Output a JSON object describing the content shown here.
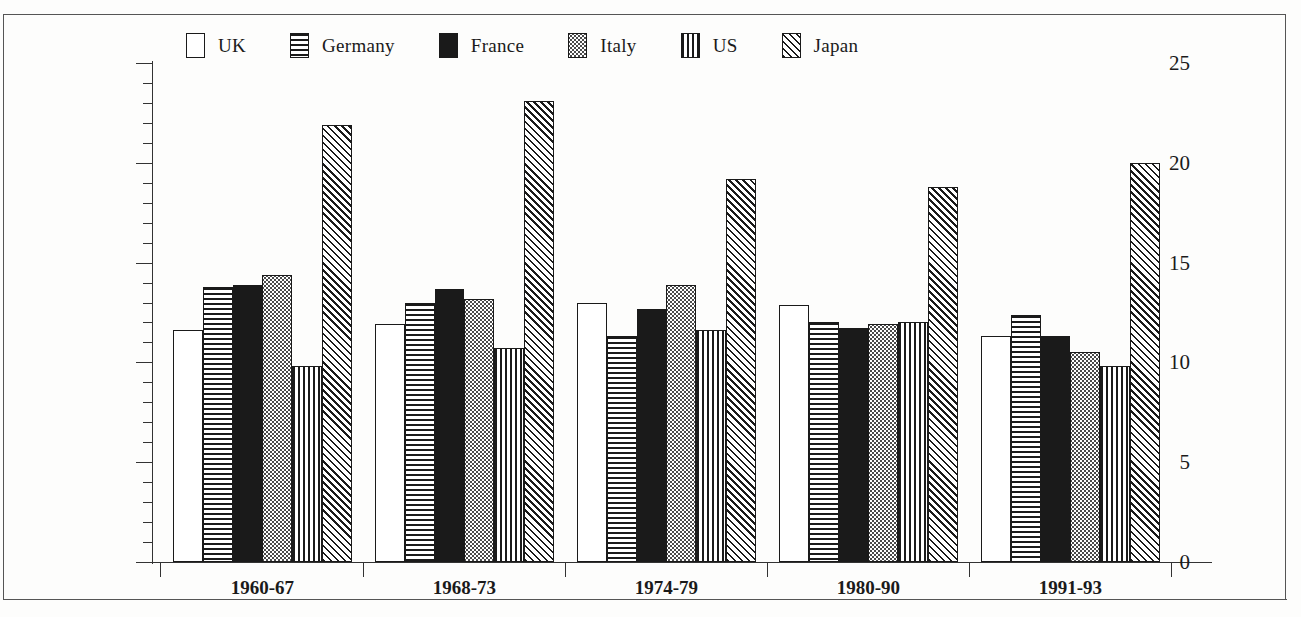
{
  "chart_data": {
    "type": "bar",
    "title": "",
    "subtitle": "",
    "xlabel": "",
    "ylabel": "",
    "ylim": [
      0,
      25
    ],
    "ytick_step_major": 5,
    "ytick_step_minor": 1,
    "ytick_labels": [
      "0",
      "5",
      "10",
      "15",
      "20",
      "25"
    ],
    "grid": false,
    "legend_position": "top",
    "grouping": "grouped",
    "categories": [
      "1960-67",
      "1968-73",
      "1974-79",
      "1980-90",
      "1991-93"
    ],
    "series": [
      {
        "name": "UK",
        "pattern": "plain",
        "values": [
          11.6,
          11.9,
          13.0,
          12.9,
          11.3
        ]
      },
      {
        "name": "Germany",
        "pattern": "hlines",
        "values": [
          13.8,
          13.0,
          11.3,
          12.0,
          12.4
        ]
      },
      {
        "name": "France",
        "pattern": "solid",
        "values": [
          13.9,
          13.7,
          12.7,
          11.7,
          11.3
        ]
      },
      {
        "name": "Italy",
        "pattern": "dots",
        "values": [
          14.4,
          13.2,
          13.9,
          11.9,
          10.5
        ]
      },
      {
        "name": "US",
        "pattern": "vlines",
        "values": [
          9.8,
          10.7,
          11.6,
          12.0,
          9.8
        ]
      },
      {
        "name": "Japan",
        "pattern": "diag",
        "values": [
          21.9,
          23.1,
          19.2,
          18.8,
          20.0
        ]
      }
    ]
  },
  "legend": {
    "items": [
      {
        "label": "UK",
        "pattern": "plain"
      },
      {
        "label": "Germany",
        "pattern": "hlines"
      },
      {
        "label": "France",
        "pattern": "solid"
      },
      {
        "label": "Italy",
        "pattern": "dots"
      },
      {
        "label": "US",
        "pattern": "vlines"
      },
      {
        "label": "Japan",
        "pattern": "diag"
      }
    ]
  },
  "colors": {
    "ink": "#1a1a1a",
    "axis": "#333333",
    "frame": "#555555",
    "background": "#fdfdfc"
  }
}
